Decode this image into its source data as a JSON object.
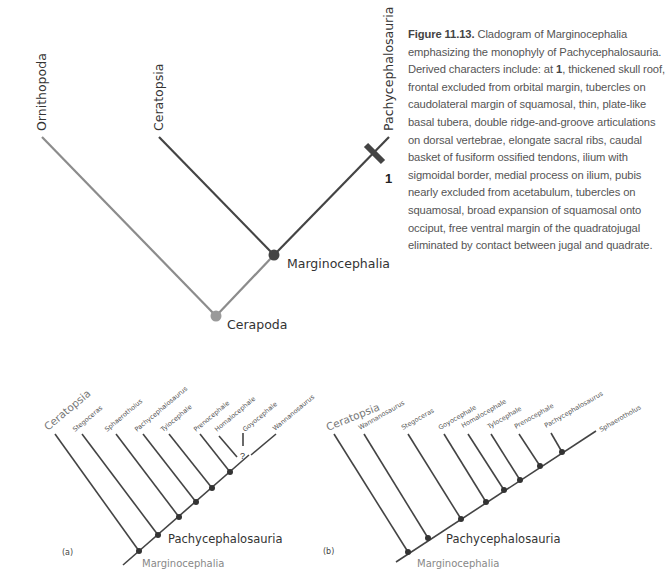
{
  "figure": {
    "number": "Figure 11.13.",
    "caption_lead": "Cladogram of Marginocephalia emphasizing the monophyly of Pachycephalosauria. Derived characters include: at ",
    "caption_marker": "1",
    "caption_rest": ", thickened skull roof, frontal excluded from orbital margin, tubercles on caudolateral margin of squamosal, thin, plate-like basal tubera, double ridge-and-groove articulations on dorsal vertebrae, elongate sacral ribs, caudal basket of fusiform ossified tendons, ilium with sigmoidal border, medial process on ilium, pubis nearly excluded from acetabulum, tubercles on squamosal, broad expansion of squamosal onto occiput, free ventral margin of the quadratojugal eliminated by contact between jugal and quadrate."
  },
  "main_cladogram": {
    "taxa": [
      "Ornithopoda",
      "Ceratopsia",
      "Pachycephalosauria"
    ],
    "nodes": [
      "Cerapoda",
      "Marginocephalia"
    ],
    "character_marker": "1",
    "colors": {
      "ornithopoda_branch": "#8c8c8c",
      "cerapoda_node": "#9a9a9a",
      "dark_branch": "#444444"
    }
  },
  "cladogram_a": {
    "panel_label": "(a)",
    "outgroup": "Ceratopsia",
    "taxa": [
      "Stegoceras",
      "Sphaerotholus",
      "Pachycephalosaurus",
      "Tylocephale",
      "Prenocephale",
      "Homalocephale",
      "Goyocephale",
      "Wannanosaurus"
    ],
    "uncertainty_marker": "?",
    "clade_label": "Pachycephalosauria",
    "root_label": "Marginocephalia"
  },
  "cladogram_b": {
    "panel_label": "(b)",
    "outgroup": "Ceratopsia",
    "taxa": [
      "Wannanosaurus",
      "Stegoceras",
      "Goyocephale",
      "Homalocephale",
      "Tylocephale",
      "Prenocephale",
      "Pachycephalosaurus",
      "Sphaerotholus"
    ],
    "clade_label": "Pachycephalosauria",
    "root_label": "Marginocephalia"
  }
}
